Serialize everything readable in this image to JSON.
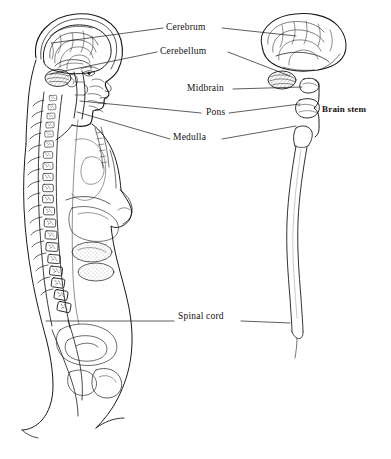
{
  "figure": {
    "background_color": "#ffffff",
    "ink_color": "#1a1a1a",
    "line_color": "#222222"
  },
  "labels": {
    "cerebrum": "Cerebrum",
    "cerebellum": "Cerebellum",
    "midbrain": "Midbrain",
    "pons": "Pons",
    "medulla": "Medulla",
    "brain_stem": "Brain stem",
    "spinal_cord": "Spinal cord"
  },
  "structures": {
    "left_figure": "human head and torso in mid-sagittal section, facing right, showing brain, vertebral column and viscera",
    "right_figure": "exploded lateral view of brain, brain stem segments and spinal cord",
    "brain_stem_parts": [
      "Midbrain",
      "Pons",
      "Medulla"
    ],
    "brain_stem_brace": "}"
  },
  "leader_lines": [
    {
      "label": "cerebrum",
      "from_x": 163,
      "from_y": 28,
      "to_x": 52,
      "to_y": 43
    },
    {
      "label": "cerebrum",
      "from_x": 222,
      "from_y": 28,
      "to_x": 296,
      "to_y": 36
    },
    {
      "label": "cerebellum",
      "from_x": 157,
      "from_y": 52,
      "to_x": 50,
      "to_y": 74
    },
    {
      "label": "cerebellum",
      "from_x": 227,
      "from_y": 52,
      "to_x": 288,
      "to_y": 76
    },
    {
      "label": "midbrain",
      "from_x": 232,
      "from_y": 89,
      "to_x": 302,
      "to_y": 88
    },
    {
      "label": "pons",
      "from_x": 200,
      "from_y": 113,
      "to_x": 79,
      "to_y": 101
    },
    {
      "label": "pons",
      "from_x": 228,
      "from_y": 113,
      "to_x": 300,
      "to_y": 105
    },
    {
      "label": "medulla",
      "from_x": 170,
      "from_y": 139,
      "to_x": 76,
      "to_y": 112
    },
    {
      "label": "medulla",
      "from_x": 222,
      "from_y": 139,
      "to_x": 296,
      "to_y": 125
    },
    {
      "label": "spinal_cord",
      "from_x": 175,
      "from_y": 321,
      "to_x": 46,
      "to_y": 321
    },
    {
      "label": "spinal_cord",
      "from_x": 241,
      "from_y": 321,
      "to_x": 290,
      "to_y": 324
    }
  ]
}
